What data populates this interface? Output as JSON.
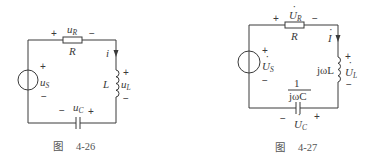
{
  "figures": [
    {
      "id": "fig-4-26",
      "caption_prefix": "图",
      "caption_number": "4-26",
      "domain": "time",
      "source": {
        "label": "u",
        "sub": "S",
        "plus": "+",
        "minus": "−"
      },
      "resistor": {
        "name": "R",
        "voltage": "u",
        "voltage_sub": "R",
        "plus": "+",
        "minus": "−"
      },
      "current": {
        "label": "i"
      },
      "inductor": {
        "name": "L",
        "voltage": "u",
        "voltage_sub": "L",
        "plus": "+",
        "minus": "−"
      },
      "capacitor": {
        "voltage": "u",
        "voltage_sub": "C",
        "plus": "+",
        "minus": "−"
      }
    },
    {
      "id": "fig-4-27",
      "caption_prefix": "图",
      "caption_number": "4-27",
      "domain": "phasor",
      "source": {
        "label": "U",
        "sub": "S",
        "dot": "·",
        "plus": "+",
        "minus": "−"
      },
      "resistor": {
        "name": "R",
        "voltage": "U",
        "voltage_sub": "R",
        "dot": "·",
        "plus": "+",
        "minus": "−"
      },
      "current": {
        "label": "I",
        "dot": "·"
      },
      "inductor": {
        "impedance": "jωL",
        "voltage": "U",
        "voltage_sub": "L",
        "dot": "·",
        "plus": "+",
        "minus": "−"
      },
      "capacitor": {
        "impedance_num": "1",
        "impedance_den": "jωC",
        "voltage": "U",
        "voltage_sub": "C",
        "dot": "·",
        "plus": "+",
        "minus": "−"
      }
    }
  ]
}
